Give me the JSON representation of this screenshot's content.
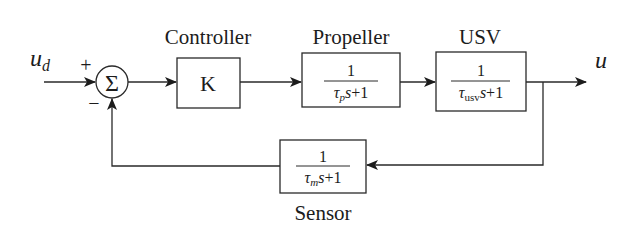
{
  "diagram": {
    "type": "feedback-control-block-diagram",
    "input": {
      "symbol": "u",
      "subscript": "d"
    },
    "output": {
      "symbol": "u"
    },
    "summing_junction": {
      "symbol": "Σ",
      "plus_sign": "+",
      "minus_sign": "−"
    },
    "blocks": {
      "controller": {
        "title": "Controller",
        "content": "K"
      },
      "propeller": {
        "title": "Propeller",
        "numerator": "1",
        "tau": "τ",
        "tau_sub": "p",
        "den_rest": "s+1"
      },
      "usv": {
        "title": "USV",
        "numerator": "1",
        "tau": "τ",
        "tau_sub": "usv",
        "den_rest": "s+1"
      },
      "sensor": {
        "title": "Sensor",
        "numerator": "1",
        "tau": "τ",
        "tau_sub": "m",
        "den_rest": "s+1"
      }
    },
    "colors": {
      "line": "#2a2a2a",
      "text": "#1c1c1c",
      "background": "#ffffff"
    }
  }
}
